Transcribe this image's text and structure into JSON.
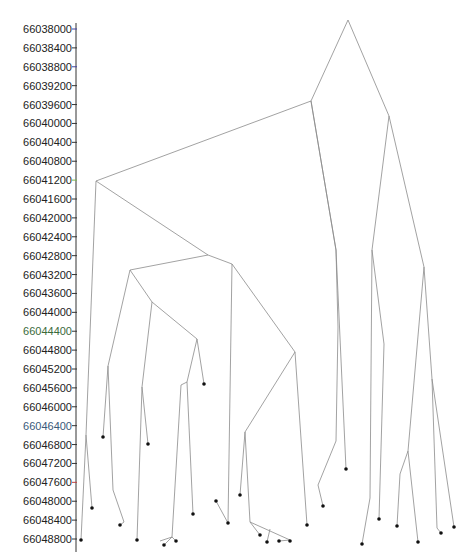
{
  "diagram": {
    "type": "tree",
    "axis": {
      "ticks": [
        "66038000",
        "66038400",
        "66038800",
        "66039200",
        "66039600",
        "66040000",
        "66040400",
        "66040800",
        "66041200",
        "66041600",
        "66042000",
        "66042400",
        "66042800",
        "66043200",
        "66043600",
        "66044000",
        "66044400",
        "66044800",
        "66045200",
        "66045600",
        "66046000",
        "66046400",
        "66046800",
        "66047200",
        "66047600",
        "66048000",
        "66048400",
        "66048800"
      ],
      "tick_colors": [
        "#4040a0",
        "#333",
        "#4040a0",
        "#333",
        "#333",
        "#333",
        "#333",
        "#333",
        "#7ab648",
        "#333",
        "#333",
        "#333",
        "#333",
        "#333",
        "#333",
        "#333",
        "#333",
        "#333",
        "#333",
        "#333",
        "#333",
        "#333",
        "#333",
        "#333",
        "#c04040",
        "#333",
        "#333",
        "#333"
      ],
      "label_colors": [
        "#222",
        "#222",
        "#222",
        "#222",
        "#222",
        "#222",
        "#222",
        "#222",
        "#222",
        "#222",
        "#222",
        "#222",
        "#222",
        "#222",
        "#222",
        "#222",
        "#3a6a3a",
        "#222",
        "#222",
        "#222",
        "#222",
        "#3a5a7a",
        "#222",
        "#222",
        "#222",
        "#222",
        "#222",
        "#222"
      ]
    },
    "edges": [
      [
        348,
        20,
        311,
        101
      ],
      [
        348,
        20,
        389,
        116
      ],
      [
        311,
        101,
        96,
        181
      ],
      [
        311,
        101,
        336,
        250
      ],
      [
        311,
        101,
        336,
        250
      ],
      [
        96,
        181,
        86,
        435
      ],
      [
        96,
        181,
        208,
        255
      ],
      [
        86,
        435,
        81,
        540
      ],
      [
        86,
        435,
        92,
        508
      ],
      [
        208,
        255,
        130,
        270
      ],
      [
        208,
        255,
        232,
        264
      ],
      [
        130,
        270,
        108,
        366
      ],
      [
        130,
        270,
        152,
        302
      ],
      [
        108,
        366,
        103,
        437
      ],
      [
        108,
        366,
        113,
        490
      ],
      [
        113,
        490,
        124,
        522
      ],
      [
        124,
        522,
        120,
        525
      ],
      [
        152,
        302,
        142,
        387
      ],
      [
        152,
        302,
        197,
        339
      ],
      [
        142,
        387,
        137,
        540
      ],
      [
        142,
        387,
        148,
        444
      ],
      [
        197,
        339,
        187,
        382
      ],
      [
        197,
        339,
        204,
        384
      ],
      [
        187,
        382,
        181,
        385
      ],
      [
        181,
        385,
        172,
        537
      ],
      [
        172,
        537,
        160,
        541
      ],
      [
        172,
        537,
        164,
        545
      ],
      [
        172,
        537,
        176,
        541
      ],
      [
        187,
        382,
        193,
        514
      ],
      [
        232,
        264,
        228,
        523
      ],
      [
        232,
        264,
        295,
        352
      ],
      [
        295,
        352,
        245,
        432
      ],
      [
        295,
        352,
        307,
        525
      ],
      [
        245,
        432,
        240,
        495
      ],
      [
        245,
        432,
        250,
        522
      ],
      [
        250,
        522,
        290,
        540
      ],
      [
        250,
        522,
        260,
        535
      ],
      [
        270,
        529,
        267,
        542
      ],
      [
        290,
        540,
        279,
        541
      ],
      [
        290,
        540,
        290,
        541
      ],
      [
        228,
        523,
        216,
        501
      ],
      [
        336,
        250,
        338,
        327
      ],
      [
        336,
        250,
        346,
        469
      ],
      [
        338,
        327,
        336,
        441
      ],
      [
        336,
        441,
        318,
        485
      ],
      [
        318,
        485,
        323,
        506
      ],
      [
        389,
        116,
        372,
        250
      ],
      [
        389,
        116,
        424,
        267
      ],
      [
        372,
        250,
        370,
        498
      ],
      [
        370,
        498,
        362,
        544
      ],
      [
        372,
        250,
        384,
        344
      ],
      [
        384,
        344,
        379,
        519
      ],
      [
        424,
        267,
        408,
        451
      ],
      [
        408,
        451,
        400,
        474
      ],
      [
        400,
        474,
        397,
        526
      ],
      [
        408,
        451,
        418,
        542
      ],
      [
        424,
        267,
        432,
        379
      ],
      [
        432,
        379,
        437,
        528
      ],
      [
        437,
        528,
        441,
        533
      ],
      [
        432,
        379,
        454,
        527
      ]
    ],
    "leaves": [
      [
        81,
        540
      ],
      [
        92,
        508
      ],
      [
        103,
        437
      ],
      [
        120,
        525
      ],
      [
        137,
        540
      ],
      [
        148,
        444
      ],
      [
        164,
        545
      ],
      [
        176,
        541
      ],
      [
        193,
        514
      ],
      [
        204,
        384
      ],
      [
        216,
        501
      ],
      [
        228,
        523
      ],
      [
        240,
        495
      ],
      [
        260,
        535
      ],
      [
        267,
        542
      ],
      [
        279,
        541
      ],
      [
        290,
        541
      ],
      [
        307,
        525
      ],
      [
        323,
        506
      ],
      [
        346,
        469
      ],
      [
        362,
        544
      ],
      [
        379,
        519
      ],
      [
        397,
        526
      ],
      [
        418,
        542
      ],
      [
        441,
        533
      ],
      [
        454,
        527
      ]
    ],
    "colors": {
      "edge": "#8a8a8a",
      "leaf": "#111111",
      "axis": "#333333"
    }
  }
}
